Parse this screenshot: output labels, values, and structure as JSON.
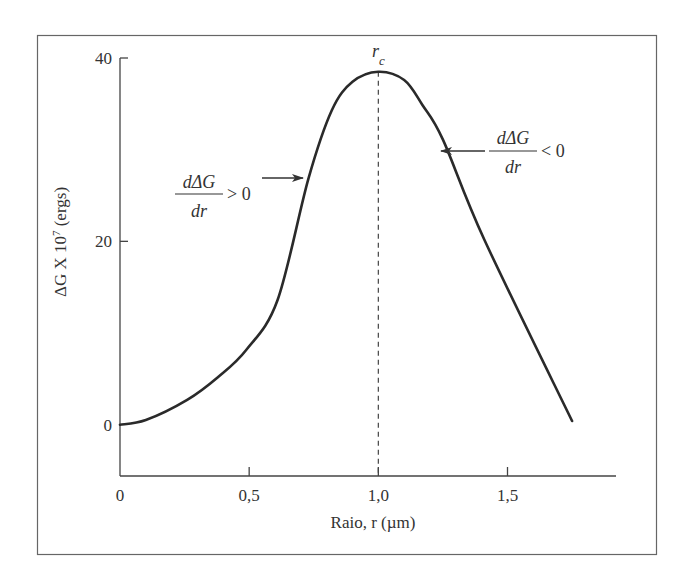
{
  "chart_data": {
    "type": "line",
    "title": "",
    "xlabel": "Raio, r (µm)",
    "ylabel": "ΔG X 10",
    "ylabel_superscript": "7",
    "ylabel_suffix": " (ergs)",
    "xlim": [
      0,
      1.92
    ],
    "ylim": [
      -5.6,
      40
    ],
    "x_ticks": [
      {
        "value": 0,
        "label": "0"
      },
      {
        "value": 0.5,
        "label": "0,5"
      },
      {
        "value": 1.0,
        "label": "1,0"
      },
      {
        "value": 1.5,
        "label": "1,5"
      }
    ],
    "y_ticks": [
      {
        "value": 0,
        "label": "0"
      },
      {
        "value": 20,
        "label": "20"
      },
      {
        "value": 40,
        "label": "40"
      }
    ],
    "grid": false,
    "legend": null,
    "series": [
      {
        "name": "ΔG",
        "x": [
          0,
          0.1,
          0.26,
          0.38,
          0.49,
          0.61,
          0.73,
          0.82,
          0.9,
          1.0,
          1.1,
          1.17,
          1.25,
          1.41,
          1.75
        ],
        "y": [
          0,
          0.5,
          2.7,
          5.2,
          8.2,
          13.6,
          26.9,
          34.3,
          37.4,
          38.5,
          37.6,
          34.9,
          31.1,
          20.2,
          0.4
        ]
      }
    ],
    "annotations": [
      {
        "type": "vline",
        "x": 1.0,
        "label": "r",
        "label_subscript": "c",
        "style": "dashed"
      },
      {
        "type": "arrow",
        "text_numerator": "dΔG",
        "text_denominator": "dr",
        "text_relation": "> 0",
        "side": "left",
        "target": {
          "x": 0.73,
          "y": 26.9
        }
      },
      {
        "type": "arrow",
        "text_numerator": "dΔG",
        "text_denominator": "dr",
        "text_relation": "< 0",
        "side": "right",
        "target": {
          "x": 1.26,
          "y": 30.0
        }
      }
    ]
  }
}
